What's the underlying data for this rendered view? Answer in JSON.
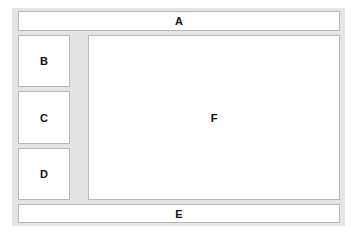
{
  "diagram": {
    "type": "page-layout-wireframe",
    "regions": {
      "header": {
        "label": "A"
      },
      "sidebar_top": {
        "label": "B"
      },
      "sidebar_middle": {
        "label": "C"
      },
      "sidebar_bottom": {
        "label": "D"
      },
      "footer": {
        "label": "E"
      },
      "main": {
        "label": "F"
      }
    },
    "colors": {
      "frame": "#e4e4e4",
      "box": "#ffffff",
      "border": "#b8b8b8",
      "text": "#111111"
    }
  }
}
